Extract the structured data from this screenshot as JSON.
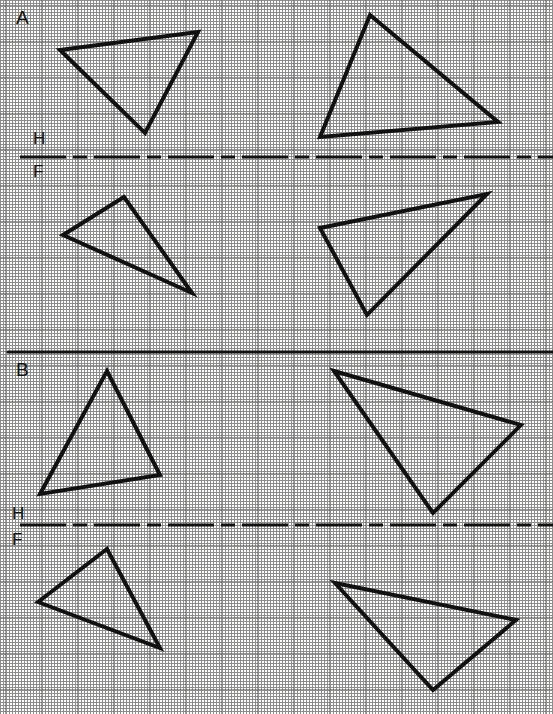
{
  "sheet": {
    "width": 553,
    "height": 714,
    "background_color": "#fdfdfb",
    "grid": {
      "type": "dotted-graph-paper",
      "fine_spacing_px": 9,
      "major_spacing_px": 36,
      "dot_color": "#8c8c8c",
      "major_line_color": "#5a5a5a"
    },
    "ink_color": "#111111"
  },
  "problems": [
    {
      "id": "A",
      "label": "A",
      "label_x": 16,
      "label_y": 8,
      "fold_line": {
        "label_top": "H",
        "label_bottom": "F",
        "label_top_x": 33,
        "label_top_y": 130,
        "label_bottom_x": 33,
        "label_bottom_y": 163,
        "y": 157,
        "x_start": 20,
        "x_end": 553,
        "style": "dash-dot",
        "width_px": 3
      },
      "views": [
        {
          "name": "top-view-left",
          "position": "above-fold-left",
          "points": [
            [
              60,
              50
            ],
            [
              198,
              32
            ],
            [
              145,
              133
            ]
          ]
        },
        {
          "name": "top-view-right",
          "position": "above-fold-right",
          "points": [
            [
              370,
              15
            ],
            [
              498,
              122
            ],
            [
              320,
              137
            ]
          ]
        },
        {
          "name": "front-view-left",
          "position": "below-fold-left",
          "points": [
            [
              63,
              235
            ],
            [
              124,
              197
            ],
            [
              192,
              293
            ]
          ]
        },
        {
          "name": "front-view-right",
          "position": "below-fold-right",
          "points": [
            [
              320,
              228
            ],
            [
              487,
              194
            ],
            [
              367,
              315
            ]
          ]
        }
      ]
    },
    {
      "id": "B",
      "label": "B",
      "label_x": 16,
      "label_y": 360,
      "fold_line": {
        "label_top": "H",
        "label_bottom": "F",
        "label_top_x": 12,
        "label_top_y": 505,
        "label_bottom_x": 12,
        "label_bottom_y": 531,
        "y": 525,
        "x_start": 20,
        "x_end": 553,
        "style": "dash-dot",
        "width_px": 3
      },
      "views": [
        {
          "name": "top-view-left",
          "position": "above-fold-left",
          "points": [
            [
              107,
              371
            ],
            [
              160,
              475
            ],
            [
              40,
              494
            ]
          ]
        },
        {
          "name": "top-view-right",
          "position": "above-fold-right",
          "points": [
            [
              334,
              371
            ],
            [
              521,
              425
            ],
            [
              433,
              513
            ]
          ]
        },
        {
          "name": "front-view-left",
          "position": "below-fold-left",
          "points": [
            [
              38,
              602
            ],
            [
              107,
              549
            ],
            [
              160,
              648
            ]
          ]
        },
        {
          "name": "front-view-right",
          "position": "below-fold-right",
          "points": [
            [
              335,
              583
            ],
            [
              516,
              620
            ],
            [
              433,
              690
            ]
          ]
        }
      ]
    }
  ],
  "separator": {
    "name": "problem-divider",
    "y": 352,
    "x_start": 8,
    "x_end": 553,
    "style": "solid",
    "width_px": 3
  },
  "shape_style": {
    "stroke_color": "#111111",
    "stroke_width_px": 4
  }
}
